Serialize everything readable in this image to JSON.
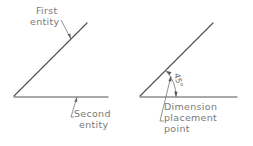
{
  "left_diagram": {
    "first_entity_label": [
      "First",
      "entity"
    ],
    "second_entity_label": [
      "Second",
      "entity"
    ]
  },
  "right_diagram": {
    "angle_dimension": "45°",
    "placement_label": [
      "Dimension",
      "placement",
      "point"
    ]
  },
  "colors": {
    "line": "#555555",
    "text": "#7a7a7a",
    "background": "#ffffff"
  }
}
